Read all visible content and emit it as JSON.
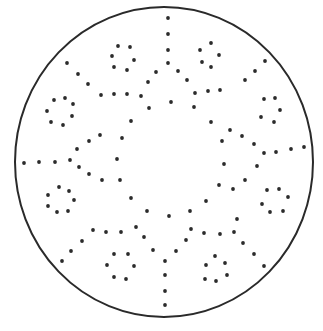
{
  "figure": {
    "width": 323,
    "height": 331,
    "background": "#ffffff",
    "stroke_color": "#2a2a2a",
    "dot_color": "#2b2b2b",
    "outer_circle": {
      "cx": 164,
      "cy": 162,
      "rx": 149,
      "ry": 155,
      "stroke_width": 2
    },
    "groups": {
      "top_spoke": [
        [
          168,
          18
        ],
        [
          168,
          34
        ],
        [
          168,
          50
        ],
        [
          168,
          63
        ]
      ],
      "bottom_spoke": [
        [
          165,
          261
        ],
        [
          165,
          275
        ],
        [
          165,
          291
        ],
        [
          165,
          305
        ]
      ],
      "left_spoke": [
        [
          24,
          163
        ],
        [
          39,
          162
        ],
        [
          55,
          162
        ],
        [
          70,
          160
        ]
      ],
      "right_spoke": [
        [
          264,
          153
        ],
        [
          276,
          152
        ],
        [
          291,
          149
        ],
        [
          304,
          147
        ]
      ],
      "upper_left_diagonal": [
        [
          67,
          63
        ],
        [
          78,
          74
        ],
        [
          88,
          84
        ]
      ],
      "upper_right_diagonal": [
        [
          265,
          61
        ],
        [
          255,
          71
        ],
        [
          245,
          80
        ]
      ],
      "lower_left_diagonal": [
        [
          62,
          261
        ],
        [
          71,
          251
        ],
        [
          82,
          241
        ]
      ],
      "lower_right_diagonal": [
        [
          243,
          243
        ],
        [
          254,
          254
        ],
        [
          264,
          266
        ]
      ],
      "top_left_small_circle": [
        [
          118,
          46
        ],
        [
          130,
          47
        ],
        [
          112,
          56
        ],
        [
          134,
          60
        ],
        [
          114,
          67
        ],
        [
          127,
          70
        ]
      ],
      "top_right_small_circle": [
        [
          200,
          50
        ],
        [
          211,
          43
        ],
        [
          202,
          62
        ],
        [
          211,
          67
        ],
        [
          219,
          55
        ]
      ],
      "upper_left_small_circle": [
        [
          54,
          100
        ],
        [
          65,
          98
        ],
        [
          73,
          104
        ],
        [
          47,
          111
        ],
        [
          72,
          116
        ],
        [
          51,
          122
        ],
        [
          63,
          125
        ]
      ],
      "upper_right_small_circle": [
        [
          264,
          99
        ],
        [
          275,
          98
        ],
        [
          280,
          110
        ],
        [
          261,
          117
        ],
        [
          274,
          122
        ]
      ],
      "lower_left_small_circle": [
        [
          59,
          187
        ],
        [
          69,
          191
        ],
        [
          48,
          195
        ],
        [
          74,
          200
        ],
        [
          48,
          206
        ],
        [
          57,
          212
        ],
        [
          68,
          211
        ]
      ],
      "lower_right_small_circle": [
        [
          267,
          190
        ],
        [
          279,
          189
        ],
        [
          288,
          197
        ],
        [
          262,
          204
        ],
        [
          270,
          212
        ],
        [
          283,
          211
        ]
      ],
      "bottom_left_small_circle": [
        [
          114,
          254
        ],
        [
          128,
          254
        ],
        [
          107,
          265
        ],
        [
          134,
          266
        ],
        [
          114,
          277
        ],
        [
          126,
          279
        ]
      ],
      "bottom_right_small_circle": [
        [
          215,
          256
        ],
        [
          206,
          265
        ],
        [
          225,
          263
        ],
        [
          205,
          279
        ],
        [
          216,
          281
        ],
        [
          227,
          275
        ]
      ],
      "top_connectors": [
        [
          156,
          72
        ],
        [
          178,
          71
        ],
        [
          148,
          82
        ],
        [
          187,
          80
        ],
        [
          101,
          95
        ],
        [
          114,
          94
        ],
        [
          127,
          94
        ],
        [
          141,
          96
        ],
        [
          195,
          93
        ],
        [
          208,
          91
        ],
        [
          220,
          90
        ]
      ],
      "side_connectors": [
        [
          77,
          149
        ],
        [
          89,
          141
        ],
        [
          100,
          135
        ],
        [
          79,
          167
        ],
        [
          89,
          174
        ],
        [
          102,
          180
        ],
        [
          230,
          130
        ],
        [
          242,
          136
        ],
        [
          254,
          144
        ],
        [
          257,
          166
        ],
        [
          245,
          180
        ],
        [
          233,
          189
        ]
      ],
      "bottom_connectors": [
        [
          93,
          230
        ],
        [
          106,
          232
        ],
        [
          121,
          232
        ],
        [
          136,
          227
        ],
        [
          144,
          237
        ],
        [
          153,
          250
        ],
        [
          176,
          251
        ],
        [
          186,
          240
        ],
        [
          191,
          229
        ],
        [
          204,
          233
        ],
        [
          220,
          234
        ],
        [
          234,
          232
        ],
        [
          237,
          219
        ]
      ],
      "central_ring": [
        [
          149,
          108
        ],
        [
          171,
          102
        ],
        [
          194,
          107
        ],
        [
          131,
          121
        ],
        [
          211,
          122
        ],
        [
          122,
          138
        ],
        [
          222,
          141
        ],
        [
          117,
          159
        ],
        [
          224,
          164
        ],
        [
          120,
          180
        ],
        [
          219,
          185
        ],
        [
          131,
          198
        ],
        [
          206,
          201
        ],
        [
          147,
          211
        ],
        [
          169,
          216
        ],
        [
          190,
          211
        ]
      ]
    }
  }
}
